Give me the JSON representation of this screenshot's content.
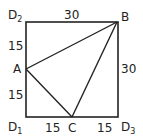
{
  "diagram": {
    "points": {
      "D2": {
        "label": "D",
        "sub": "2"
      },
      "B": {
        "label": "B"
      },
      "D3": {
        "label": "D",
        "sub": "3"
      },
      "D1": {
        "label": "D",
        "sub": "1"
      },
      "A": {
        "label": "A"
      },
      "C": {
        "label": "C"
      }
    },
    "lengths": {
      "top": "30",
      "right": "30",
      "left_upper": "15",
      "left_lower": "15",
      "bottom_left": "15",
      "bottom_right": "15"
    }
  }
}
